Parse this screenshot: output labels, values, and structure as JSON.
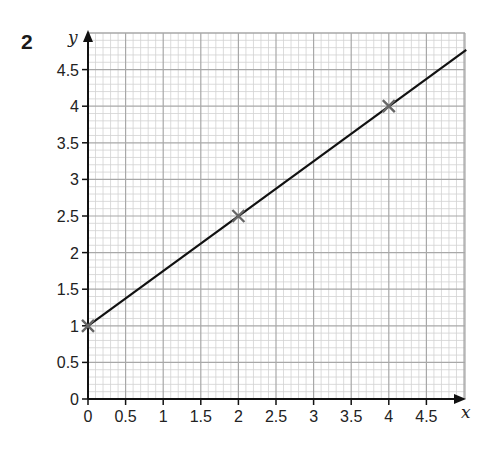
{
  "question_number": "2",
  "chart_data": {
    "type": "line",
    "title": "",
    "xlabel": "x",
    "ylabel": "y",
    "xlim": [
      0,
      5
    ],
    "ylim": [
      0,
      4.8
    ],
    "grid": true,
    "grid_major_step": 0.5,
    "grid_minor_step": 0.1,
    "x_ticks": [
      "0",
      "0.5",
      "1",
      "1.5",
      "2",
      "2.5",
      "3",
      "3.5",
      "4",
      "4.5"
    ],
    "y_ticks": [
      "0",
      "0.5",
      "1",
      "1.5",
      "2",
      "2.5",
      "3",
      "3.5",
      "4",
      "4.5"
    ],
    "series": [
      {
        "name": "line",
        "equation": "y = 0.75x + 1",
        "x": [
          0,
          5.03
        ],
        "y": [
          1,
          4.77
        ]
      }
    ],
    "points": [
      {
        "x": 0,
        "y": 1,
        "marker": "x"
      },
      {
        "x": 2,
        "y": 2.5,
        "marker": "x"
      },
      {
        "x": 4,
        "y": 4,
        "marker": "x"
      }
    ],
    "colors": {
      "grid_major": "#a8a8a8",
      "grid_minor": "#d2d2d2",
      "line": "#111111",
      "marker": "#666666"
    }
  }
}
